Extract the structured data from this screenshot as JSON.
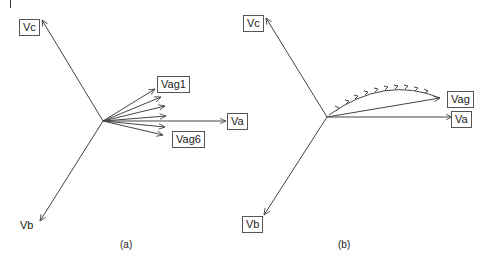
{
  "figure": {
    "panels": [
      {
        "id": "a",
        "caption": "(a)",
        "labels": {
          "vc": "Vc",
          "vb": "Vb",
          "va": "Va",
          "vag1": "Vag1",
          "vag6": "Vag6"
        },
        "description": "Three-phase phasors Va, Vb, Vc with fan of six Vag phasors (Vag1 to Vag6) spread around Va"
      },
      {
        "id": "b",
        "caption": "(b)",
        "labels": {
          "vc": "Vc",
          "vb": "Vb",
          "va": "Va",
          "vag": "Vag"
        },
        "description": "Three-phase phasors Va, Vb, Vc with Vag phasor whose tip traces an arced path of arrows"
      }
    ],
    "colors": {
      "line": "#444444",
      "text": "#222222",
      "box_border": "#555555"
    }
  }
}
